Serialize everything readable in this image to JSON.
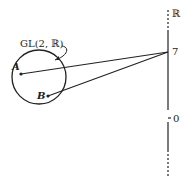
{
  "diagram": {
    "group_label": "GL(2, ℝ)",
    "axis_label": "ℝ",
    "points": [
      {
        "label": "A"
      },
      {
        "label": "B"
      }
    ],
    "axis_ticks": [
      {
        "label": "7"
      },
      {
        "label": "0"
      }
    ],
    "colors": {
      "stroke": "#222222",
      "background": "#ffffff"
    }
  }
}
